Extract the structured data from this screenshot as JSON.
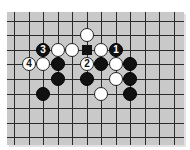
{
  "board": {
    "background": "#c9c9c9",
    "line_color": "#2a2a2a",
    "columns_x": [
      14,
      29,
      43,
      58,
      72,
      87,
      101,
      116,
      130,
      145,
      159,
      174
    ],
    "rows_y": [
      21,
      35,
      50,
      64,
      79,
      94,
      108,
      123,
      137
    ]
  },
  "stones": [
    {
      "color": "white",
      "col": 5,
      "row": 1,
      "label": ""
    },
    {
      "color": "black",
      "col": 2,
      "row": 2,
      "label": "3"
    },
    {
      "color": "white",
      "col": 3,
      "row": 2,
      "label": ""
    },
    {
      "color": "white",
      "col": 4,
      "row": 2,
      "label": ""
    },
    {
      "color": "white",
      "col": 6,
      "row": 2,
      "label": ""
    },
    {
      "color": "black",
      "col": 7,
      "row": 2,
      "label": "1"
    },
    {
      "color": "white",
      "col": 1,
      "row": 3,
      "label": "4"
    },
    {
      "color": "white",
      "col": 2,
      "row": 3,
      "label": ""
    },
    {
      "color": "black",
      "col": 3,
      "row": 3,
      "label": ""
    },
    {
      "color": "white",
      "col": 5,
      "row": 3,
      "label": "2"
    },
    {
      "color": "black",
      "col": 6,
      "row": 3,
      "label": ""
    },
    {
      "color": "white",
      "col": 7,
      "row": 3,
      "label": ""
    },
    {
      "color": "black",
      "col": 8,
      "row": 3,
      "label": ""
    },
    {
      "color": "black",
      "col": 3,
      "row": 4,
      "label": ""
    },
    {
      "color": "black",
      "col": 5,
      "row": 4,
      "label": ""
    },
    {
      "color": "white",
      "col": 7,
      "row": 4,
      "label": ""
    },
    {
      "color": "black",
      "col": 8,
      "row": 4,
      "label": ""
    },
    {
      "color": "black",
      "col": 2,
      "row": 5,
      "label": ""
    },
    {
      "color": "white",
      "col": 6,
      "row": 5,
      "label": ""
    },
    {
      "color": "black",
      "col": 8,
      "row": 5,
      "label": ""
    }
  ],
  "markers": [
    {
      "type": "square",
      "color": "black",
      "col": 5,
      "row": 2
    }
  ]
}
